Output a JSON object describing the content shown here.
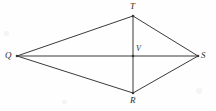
{
  "figure": {
    "type": "geometry-diagram",
    "shape_name": "kite-QTSR-with-diagonals",
    "background_color": "#fefefe",
    "line_color": "#3a3a3a",
    "line_width": 1,
    "label_color": "#2b2b2b",
    "width": 216,
    "height": 111,
    "points": {
      "Q": {
        "label": "Q",
        "x": 17,
        "y": 56
      },
      "T": {
        "label": "T",
        "x": 133,
        "y": 16
      },
      "S": {
        "label": "S",
        "x": 198,
        "y": 56
      },
      "R": {
        "label": "R",
        "x": 133,
        "y": 93
      },
      "V": {
        "label": "V",
        "x": 133,
        "y": 56
      }
    },
    "segments": [
      {
        "name": "QT",
        "from": "Q",
        "to": "T"
      },
      {
        "name": "TS",
        "from": "T",
        "to": "S"
      },
      {
        "name": "SR",
        "from": "S",
        "to": "R"
      },
      {
        "name": "RQ",
        "from": "R",
        "to": "Q"
      },
      {
        "name": "QS",
        "from": "Q",
        "to": "S"
      },
      {
        "name": "TR",
        "from": "T",
        "to": "R"
      }
    ]
  }
}
